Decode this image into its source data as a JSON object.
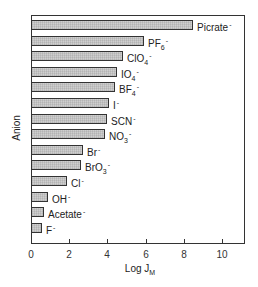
{
  "chart_data": {
    "type": "bar",
    "orientation": "horizontal",
    "title": "",
    "xlabel": "Log J_M",
    "xlabel_main": "Log J",
    "xlabel_sub": "M",
    "ylabel": "Anion",
    "xlim": [
      0,
      11.3
    ],
    "xticks": [
      0,
      2,
      4,
      6,
      8,
      10
    ],
    "grid": false,
    "legend": null,
    "categories": [
      "Picrate-",
      "PF6-",
      "ClO4-",
      "IO4-",
      "BF4-",
      "I-",
      "SCN-",
      "NO3-",
      "Br-",
      "BrO3-",
      "Cl-",
      "OH-",
      "Acetate-",
      "F-"
    ],
    "values": [
      8.5,
      5.9,
      4.8,
      4.5,
      4.4,
      4.1,
      4.0,
      3.9,
      2.7,
      2.6,
      1.9,
      0.9,
      0.7,
      0.6
    ],
    "bar_labels": [
      {
        "main": "Picrate",
        "sub": "",
        "sup": "-"
      },
      {
        "main": "PF",
        "sub": "6",
        "sup": "-"
      },
      {
        "main": "ClO",
        "sub": "4",
        "sup": "-"
      },
      {
        "main": "IO",
        "sub": "4",
        "sup": "-"
      },
      {
        "main": "BF",
        "sub": "4",
        "sup": "-"
      },
      {
        "main": "I",
        "sub": "",
        "sup": "-"
      },
      {
        "main": "SCN",
        "sub": "",
        "sup": "-"
      },
      {
        "main": "NO",
        "sub": "3",
        "sup": "-"
      },
      {
        "main": "Br",
        "sub": "",
        "sup": "-"
      },
      {
        "main": "BrO",
        "sub": "3",
        "sup": "-"
      },
      {
        "main": "Cl",
        "sub": "",
        "sup": "-"
      },
      {
        "main": "OH",
        "sub": "",
        "sup": "-"
      },
      {
        "main": "Acetate",
        "sub": "",
        "sup": "-"
      },
      {
        "main": "F",
        "sub": "",
        "sup": "-"
      }
    ],
    "colors": {
      "bar_fill": "#cfcfcf",
      "bar_edge": "#333333",
      "axis": "#333333"
    }
  }
}
